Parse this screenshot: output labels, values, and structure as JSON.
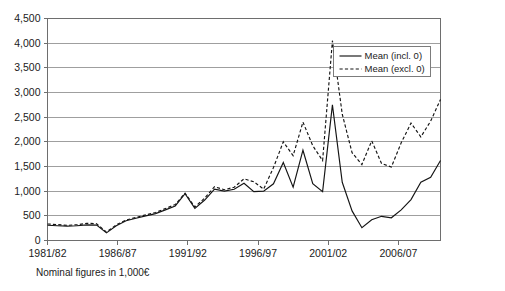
{
  "caption": "Nominal figures in 1,000€",
  "legend": {
    "position": "upper-right-inside",
    "entries": [
      {
        "label": "Mean (incl. 0)",
        "style": "solid"
      },
      {
        "label": "Mean (excl. 0)",
        "style": "dashed"
      }
    ]
  },
  "chart_data": {
    "type": "line",
    "title": "",
    "subtitle": "",
    "xlabel": "",
    "ylabel": "",
    "annotation": "Nominal figures in 1,000€",
    "grid": true,
    "legend_position": "upper right",
    "ylim": [
      0,
      4500
    ],
    "ytick_labels": [
      "0",
      "500",
      "1,000",
      "1,500",
      "2,000",
      "2,500",
      "3,000",
      "3,500",
      "4,000",
      "4,500"
    ],
    "ytick_values": [
      0,
      500,
      1000,
      1500,
      2000,
      2500,
      3000,
      3500,
      4000,
      4500
    ],
    "x": [
      "1981/82",
      "1982/83",
      "1983/84",
      "1984/85",
      "1985/86",
      "1986/87",
      "1987/88",
      "1988/89",
      "1989/90",
      "1990/91",
      "1991/92",
      "1992/93",
      "1993/94",
      "1994/95",
      "1995/96",
      "1996/97",
      "1997/98",
      "1998/99",
      "1999/00",
      "2000/01",
      "2001/02",
      "2002/03",
      "2003/04",
      "2004/05",
      "2005/06",
      "2006/07",
      "2007/08",
      "2008/09",
      "2009/10"
    ],
    "xtick_labels": [
      "1981/82",
      "1986/87",
      "1991/92",
      "1996/97",
      "2001/02",
      "2006/07"
    ],
    "xtick_indices": [
      0,
      5,
      10,
      15,
      20,
      25
    ],
    "series": [
      {
        "name": "Mean (incl. 0)",
        "style": "solid",
        "values": [
          310,
          300,
          290,
          300,
          315,
          155,
          310,
          430,
          500,
          560,
          660,
          760,
          950,
          650,
          820,
          1040,
          980,
          1000,
          1160,
          990,
          1180,
          1580,
          1080,
          1830,
          1150,
          2750,
          1500,
          1080,
          1600
        ]
      },
      {
        "name": "Mean (excl. 0)",
        "style": "dashed",
        "values": [
          330,
          320,
          305,
          315,
          345,
          170,
          325,
          445,
          520,
          580,
          690,
          790,
          960,
          680,
          860,
          1090,
          1030,
          1250,
          1190,
          1040,
          1480,
          2000,
          1720,
          2400,
          1920,
          4050,
          2300,
          1500,
          2850
        ]
      }
    ],
    "series_plot": [
      {
        "name": "Mean (incl. 0)",
        "style": "solid",
        "points": [
          [
            0,
            310
          ],
          [
            1,
            300
          ],
          [
            2,
            292
          ],
          [
            3,
            300
          ],
          [
            4,
            318
          ],
          [
            5,
            312
          ],
          [
            6,
            155
          ],
          [
            7,
            300
          ],
          [
            8,
            400
          ],
          [
            9,
            450
          ],
          [
            10,
            500
          ],
          [
            11,
            545
          ],
          [
            12,
            620
          ],
          [
            13,
            700
          ],
          [
            14,
            950
          ],
          [
            15,
            650
          ],
          [
            16,
            820
          ],
          [
            17,
            1040
          ],
          [
            18,
            1000
          ],
          [
            19,
            1040
          ],
          [
            20,
            1160
          ],
          [
            21,
            990
          ],
          [
            22,
            1000
          ],
          [
            23,
            1150
          ],
          [
            24,
            1580
          ],
          [
            25,
            1080
          ],
          [
            26,
            1830
          ],
          [
            27,
            1150
          ],
          [
            28,
            990
          ],
          [
            29,
            2750
          ],
          [
            30,
            1180
          ],
          [
            31,
            600
          ],
          [
            32,
            260
          ],
          [
            33,
            420
          ],
          [
            34,
            490
          ],
          [
            35,
            460
          ],
          [
            36,
            620
          ],
          [
            37,
            830
          ],
          [
            38,
            1180
          ],
          [
            39,
            1280
          ],
          [
            40,
            1620
          ]
        ]
      },
      {
        "name": "Mean (excl. 0)",
        "style": "dashed",
        "points": [
          [
            0,
            335
          ],
          [
            1,
            322
          ],
          [
            2,
            308
          ],
          [
            3,
            318
          ],
          [
            4,
            350
          ],
          [
            5,
            340
          ],
          [
            6,
            170
          ],
          [
            7,
            318
          ],
          [
            8,
            415
          ],
          [
            9,
            468
          ],
          [
            10,
            520
          ],
          [
            11,
            568
          ],
          [
            12,
            648
          ],
          [
            13,
            728
          ],
          [
            14,
            960
          ],
          [
            15,
            680
          ],
          [
            16,
            860
          ],
          [
            17,
            1090
          ],
          [
            18,
            1030
          ],
          [
            19,
            1080
          ],
          [
            20,
            1250
          ],
          [
            21,
            1190
          ],
          [
            22,
            1040
          ],
          [
            23,
            1480
          ],
          [
            24,
            2000
          ],
          [
            25,
            1720
          ],
          [
            26,
            2400
          ],
          [
            27,
            1920
          ],
          [
            28,
            1620
          ],
          [
            29,
            4050
          ],
          [
            30,
            2560
          ],
          [
            31,
            1780
          ],
          [
            32,
            1540
          ],
          [
            33,
            2020
          ],
          [
            34,
            1560
          ],
          [
            35,
            1490
          ],
          [
            36,
            1980
          ],
          [
            37,
            2380
          ],
          [
            38,
            2100
          ],
          [
            39,
            2420
          ],
          [
            40,
            2860
          ]
        ]
      }
    ]
  }
}
